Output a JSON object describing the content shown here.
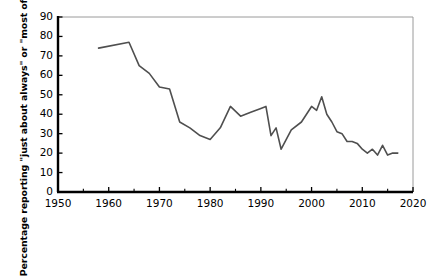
{
  "chart_data": {
    "type": "line",
    "title": "",
    "subtitle": "",
    "xlabel": "",
    "ylabel": "Percentage reporting \"just about always\" or \"most of the time\"",
    "xlim": [
      1950,
      2020
    ],
    "ylim": [
      0,
      90
    ],
    "ytick_labels": [
      "0",
      "10",
      "20",
      "30",
      "40",
      "50",
      "60",
      "70",
      "80",
      "90"
    ],
    "ytick_values": [
      0,
      10,
      20,
      30,
      40,
      50,
      60,
      70,
      80,
      90
    ],
    "xtick_labels": [
      "1950",
      "1960",
      "1970",
      "1980",
      "1990",
      "2000",
      "2010",
      "2020"
    ],
    "xtick_values": [
      1950,
      1960,
      1970,
      1980,
      1990,
      2000,
      2010,
      2020
    ],
    "x_minor_ticks": [
      1955,
      1965,
      1975,
      1985,
      1995,
      2005,
      2015
    ],
    "grid": false,
    "legend": null,
    "line_color": "#4f4f4f",
    "axis_color": "#000000",
    "frame_color": "#9a9a9a",
    "series": [
      {
        "name": "Trust in government",
        "x": [
          1958,
          1964,
          1966,
          1968,
          1970,
          1972,
          1974,
          1976,
          1978,
          1980,
          1982,
          1984,
          1986,
          1988,
          1990,
          1991,
          1992,
          1993,
          1994,
          1996,
          1998,
          2000,
          2001,
          2002,
          2003,
          2004,
          2005,
          2006,
          2007,
          2008,
          2009,
          2010,
          2011,
          2012,
          2013,
          2014,
          2015,
          2016,
          2017
        ],
        "values": [
          74,
          77,
          65,
          61,
          54,
          53,
          36,
          33,
          29,
          27,
          33,
          44,
          39,
          41,
          43,
          44,
          29,
          33,
          22,
          32,
          36,
          44,
          42,
          49,
          40,
          36,
          31,
          30,
          26,
          26,
          25,
          22,
          20,
          22,
          19,
          24,
          19,
          20,
          20
        ]
      }
    ]
  },
  "axes": {
    "plot_left_px": 58,
    "plot_right_px": 413,
    "plot_top_px": 17,
    "plot_bottom_px": 192
  }
}
